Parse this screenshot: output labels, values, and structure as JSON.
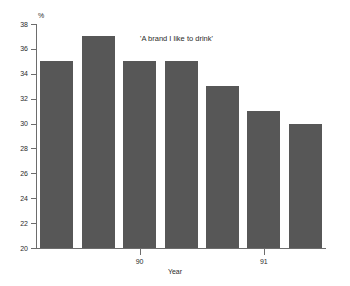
{
  "chart_data": {
    "type": "bar",
    "title": "'A brand I like to drink'",
    "xlabel": "Year",
    "ylabel": "%",
    "categories": [
      "",
      "",
      "90",
      "",
      "",
      "91",
      ""
    ],
    "values": [
      35,
      37,
      35,
      35,
      33,
      31,
      30
    ],
    "ylim": [
      20,
      38
    ],
    "yticks": [
      20,
      22,
      24,
      26,
      28,
      30,
      32,
      34,
      36,
      38
    ],
    "ytick_labels": [
      "20",
      "22",
      "24",
      "26",
      "28",
      "30",
      "32",
      "34",
      "36",
      "38"
    ],
    "xtick_labels": [
      "90",
      "91"
    ],
    "grid": false,
    "legend": false,
    "bar_color": "#575757",
    "axis_color": "#6d6d6d",
    "background": "#ffffff"
  },
  "axis": {
    "unit_label": "%",
    "x_title": "Year"
  },
  "title": {
    "text": "'A brand I like to drink'"
  }
}
